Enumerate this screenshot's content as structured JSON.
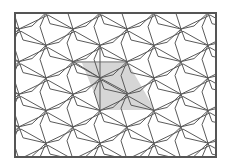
{
  "figure": {
    "type": "periodic-tiling",
    "frame": {
      "x": 15,
      "y": 13,
      "width": 201,
      "height": 144,
      "stroke": "#555555",
      "stroke_width": 2
    },
    "line_color": "#5a5a5a",
    "line_width": 1,
    "lattice": {
      "origin": [
        19,
        29
      ],
      "a": [
        54,
        0
      ],
      "b": [
        27,
        16.3
      ],
      "arms": [
        {
          "to": [
            27,
            16.3
          ],
          "bend": [
            4,
            11
          ]
        },
        {
          "to": [
            27,
            -16.3
          ],
          "bend": [
            13,
            -3
          ]
        },
        {
          "to": [
            -54,
            0
          ],
          "bend": [
            -25,
            -14
          ]
        },
        {
          "to": [
            0,
            32.6
          ],
          "bend": [
            -6,
            14
          ]
        }
      ]
    },
    "highlight": {
      "fill": "#d6d6d6",
      "points": [
        [
          82,
          63
        ],
        [
          128,
          63
        ],
        [
          155,
          110
        ],
        [
          101,
          110
        ]
      ],
      "inner_lines": [
        [
          [
            74,
            62
          ],
          [
            100,
            78
          ]
        ],
        [
          [
            100,
            78
          ],
          [
            128,
            93
          ]
        ],
        [
          [
            100,
            45
          ],
          [
            100,
            110
          ]
        ],
        [
          [
            74,
            62
          ],
          [
            128,
            62
          ]
        ]
      ]
    }
  }
}
